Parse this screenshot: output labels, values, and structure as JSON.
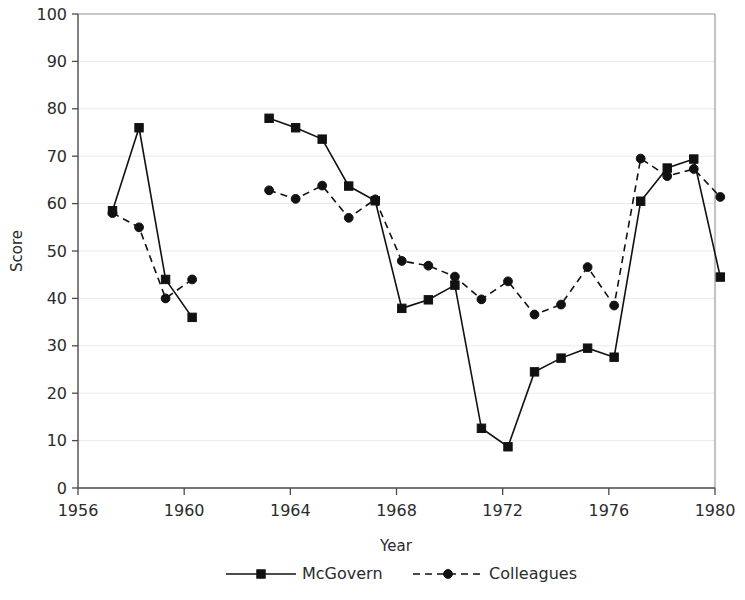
{
  "chart_data": {
    "type": "line",
    "title": "",
    "xlabel": "Year",
    "ylabel": "Score",
    "xlim": [
      1956,
      1980
    ],
    "ylim": [
      0,
      100
    ],
    "grid": true,
    "legend_position": "bottom",
    "x_ticks": [
      "1956",
      "1960",
      "1964",
      "1968",
      "1972",
      "1976",
      "1980"
    ],
    "y_ticks": [
      "0",
      "10",
      "20",
      "30",
      "40",
      "50",
      "60",
      "70",
      "80",
      "90",
      "100"
    ],
    "series": [
      {
        "name": "McGovern",
        "marker": "square",
        "line_style": "solid",
        "color": "#111111",
        "segments": [
          {
            "x": [
              1957.3,
              1958.3,
              1959.3,
              1960.3
            ],
            "values": [
              58.5,
              76.0,
              44.0,
              36.0
            ]
          },
          {
            "x": [
              1963.2,
              1964.2,
              1965.2,
              1966.2,
              1967.2,
              1968.2,
              1969.2,
              1970.2,
              1971.2,
              1972.2,
              1973.2,
              1974.2,
              1975.2,
              1976.2,
              1977.2,
              1978.2,
              1979.2,
              1980.2
            ],
            "values": [
              78.0,
              76.0,
              73.6,
              63.7,
              60.6,
              37.9,
              39.7,
              42.8,
              12.6,
              8.7,
              24.5,
              27.4,
              29.5,
              27.6,
              60.5,
              67.5,
              69.4,
              44.5
            ]
          }
        ]
      },
      {
        "name": "Colleagues",
        "marker": "circle",
        "line_style": "dashed",
        "color": "#111111",
        "segments": [
          {
            "x": [
              1957.3,
              1958.3,
              1959.3,
              1960.3
            ],
            "values": [
              58.0,
              55.0,
              40.0,
              44.0
            ]
          },
          {
            "x": [
              1963.2,
              1964.2,
              1965.2,
              1966.2,
              1967.2,
              1968.2,
              1969.2,
              1970.2,
              1971.2,
              1972.2,
              1973.2,
              1974.2,
              1975.2,
              1976.2,
              1977.2,
              1978.2,
              1979.2,
              1980.2
            ],
            "values": [
              62.8,
              61.0,
              63.8,
              57.0,
              60.9,
              47.9,
              46.9,
              44.6,
              39.8,
              43.6,
              36.6,
              38.7,
              46.6,
              38.5,
              69.5,
              65.8,
              67.3,
              61.4
            ]
          }
        ]
      }
    ]
  },
  "legend": {
    "items": [
      {
        "label": "McGovern",
        "marker": "square",
        "line_style": "solid"
      },
      {
        "label": "Colleagues",
        "marker": "circle",
        "line_style": "dashed"
      }
    ]
  },
  "axes": {
    "x_title": "Year",
    "y_title": "Score"
  }
}
